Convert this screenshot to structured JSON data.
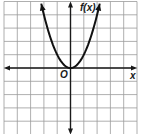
{
  "chart_data": {
    "type": "line",
    "title": "",
    "function": "f(x) = x^2",
    "xlabel": "x",
    "ylabel": "f(x)",
    "origin_label": "O",
    "xlim": [
      -5,
      5
    ],
    "ylim": [
      -5,
      5
    ],
    "grid": true,
    "grid_step": 1,
    "axis_arrows": true,
    "curve_arrows": true,
    "series": [
      {
        "name": "f(x)",
        "x": [
          -2.2,
          -2,
          -1.5,
          -1,
          -0.5,
          0,
          0.5,
          1,
          1.5,
          2,
          2.2
        ],
        "values": [
          4.84,
          4,
          2.25,
          1,
          0.25,
          0,
          0.25,
          1,
          2.25,
          4,
          4.84
        ]
      }
    ],
    "vertex": [
      0,
      0
    ]
  },
  "labels": {
    "y_axis": "f(x)",
    "x_axis": "x",
    "origin": "O"
  },
  "colors": {
    "grid": "#9a9a9a",
    "axis": "#1a1a1a",
    "curve": "#111111",
    "background": "#ffffff"
  }
}
